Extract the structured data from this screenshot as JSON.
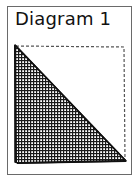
{
  "diagram": {
    "title": "Diagram 1",
    "frame_color": "#6a6a6a",
    "square": {
      "style": "dashed",
      "color": "#555555"
    },
    "triangle": {
      "fill": "crosshatch",
      "stroke_color": "#111111",
      "description": "Right triangle shading the lower-left half of the square"
    }
  }
}
